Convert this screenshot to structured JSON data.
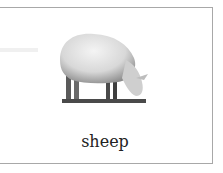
{
  "card": {
    "image": {
      "subject": "sheep",
      "alt": "grazing sheep"
    },
    "label": "sheep"
  }
}
